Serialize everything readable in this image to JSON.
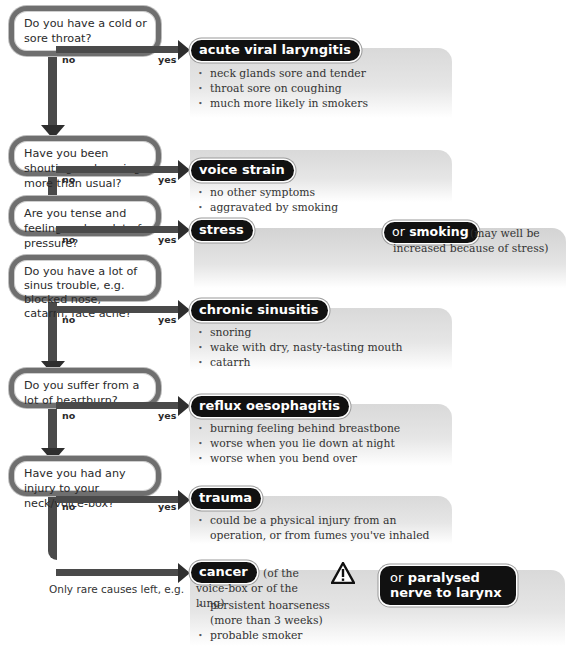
{
  "diagram": {
    "branch_labels": {
      "no": "no",
      "yes": "yes"
    },
    "steps": [
      {
        "question": "Do you have a cold or sore throat?",
        "diagnosis": "acute viral laryngitis",
        "symptoms": [
          "neck glands sore and tender",
          "throat sore on coughing",
          "much more likely in smokers"
        ]
      },
      {
        "question": "Have you been shouting and roaring more than usual?",
        "diagnosis": "voice strain",
        "symptoms": [
          "no other symptoms",
          "aggravated by smoking"
        ]
      },
      {
        "question": "Are you tense and feeling under a lot of pressure?",
        "diagnosis": "stress",
        "alt_prefix": "or",
        "alt_diagnosis": "smoking",
        "alt_note": "(may well be increased because of stress)",
        "symptoms": []
      },
      {
        "question": "Do you have a lot of sinus trouble, e.g. blocked nose, catarrh, face ache?",
        "diagnosis": "chronic sinusitis",
        "symptoms": [
          "snoring",
          "wake with dry, nasty-tasting mouth",
          "catarrh"
        ]
      },
      {
        "question": "Do you suffer from a lot of heartburn?",
        "diagnosis": "reflux oesophagitis",
        "symptoms": [
          "burning feeling behind breastbone",
          "worse when you lie down at night",
          "worse when you bend over"
        ]
      },
      {
        "question": "Have you had any injury to your neck/voice-box?",
        "diagnosis": "trauma",
        "symptoms": [
          "could be a physical injury from an operation, or from fumes you've inhaled"
        ]
      }
    ],
    "final": {
      "lead_text": "Only rare causes left, e.g.",
      "diagnosis": "cancer",
      "diagnosis_note": "(of the voice-box or of the lung)",
      "warning_icon": "warning-triangle-icon",
      "symptoms": [
        "persistent hoarseness (more than 3 weeks)",
        "probable smoker"
      ],
      "alt_prefix": "or",
      "alt_diagnosis": "paralysed nerve to larynx"
    }
  },
  "colors": {
    "pill_bg": "#111111",
    "arrow": "#4a4a4a",
    "box_border": "#6f6f6f",
    "panel_grey": "#d9d9d9"
  }
}
